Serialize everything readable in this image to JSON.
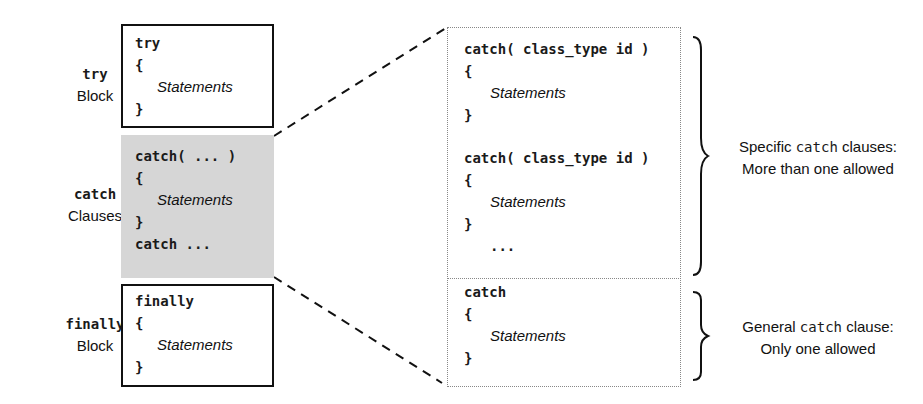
{
  "left_labels": {
    "try": {
      "keyword": "try",
      "word": "Block"
    },
    "catch": {
      "keyword": "catch",
      "word": "Clauses"
    },
    "finally": {
      "keyword": "finally",
      "word": "Block"
    }
  },
  "try_box": {
    "lines": [
      "try",
      "{",
      "Statements",
      "}"
    ]
  },
  "catch_box": {
    "lines": [
      "catch( ... )",
      "{",
      "Statements",
      "}",
      "catch ..."
    ]
  },
  "finally_box": {
    "lines": [
      "finally",
      "{",
      "Statements",
      "}"
    ]
  },
  "detail_box": {
    "specific": {
      "clause1": [
        "catch( class_type id )",
        "{",
        "Statements",
        "}"
      ],
      "clause2": [
        "catch( class_type id )",
        "{",
        "Statements",
        "}",
        "..."
      ]
    },
    "general": [
      "catch",
      "{",
      "Statements",
      "}"
    ]
  },
  "notes": {
    "specific": {
      "pre": "Specific ",
      "kw": "catch",
      "post": " clauses:",
      "line2": "More than one allowed"
    },
    "general": {
      "pre": "General ",
      "kw": "catch",
      "post": " clause:",
      "line2": "Only one allowed"
    }
  }
}
